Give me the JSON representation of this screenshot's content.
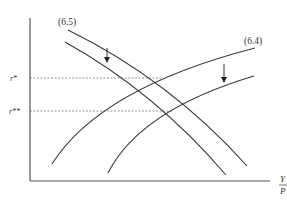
{
  "diagram": {
    "curve_labels": {
      "upper_decreasing": "(6.5)",
      "upper_increasing": "(6.4)"
    },
    "y_ticks": {
      "r_star": "r*",
      "r_double_star": "r**"
    },
    "x_axis_label": {
      "numerator": "Y",
      "denominator": "P"
    },
    "colors": {
      "line": "#3a3a3a",
      "dashed": "#7a7a7a",
      "background": "#ffffff"
    }
  }
}
